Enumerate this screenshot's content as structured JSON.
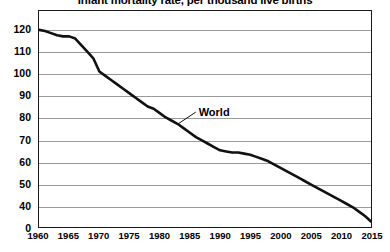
{
  "chart_data": {
    "type": "line",
    "title": "Infant mortality rate, per thousand live births",
    "xlabel": "",
    "ylabel": "",
    "xlim": [
      1960,
      2015
    ],
    "ylim": [
      30,
      120
    ],
    "grid": true,
    "legend_position": "inline-annotation",
    "y_ticks": [
      "120",
      "110",
      "100",
      "90",
      "80",
      "70",
      "60",
      "50",
      "40",
      "0"
    ],
    "y_tick_values": [
      120,
      110,
      100,
      90,
      80,
      70,
      60,
      50,
      40,
      30
    ],
    "y_axis_note": "broken axis: lowest gridline labelled 0 at the baseline",
    "x_ticks": [
      "1960",
      "1965",
      "1970",
      "1975",
      "1980",
      "1985",
      "1990",
      "1995",
      "2000",
      "2005",
      "2010",
      "2015"
    ],
    "x_tick_values": [
      1960,
      1965,
      1970,
      1975,
      1980,
      1985,
      1990,
      1995,
      2000,
      2005,
      2010,
      2015
    ],
    "series": [
      {
        "name": "World",
        "color": "#111111",
        "annotation": "World",
        "x": [
          1960,
          1961,
          1962,
          1963,
          1964,
          1965,
          1966,
          1967,
          1968,
          1969,
          1970,
          1971,
          1972,
          1973,
          1974,
          1975,
          1976,
          1977,
          1978,
          1979,
          1980,
          1981,
          1982,
          1983,
          1984,
          1985,
          1986,
          1987,
          1988,
          1989,
          1990,
          1991,
          1992,
          1993,
          1994,
          1995,
          1996,
          1997,
          1998,
          1999,
          2000,
          2001,
          2002,
          2003,
          2004,
          2005,
          2006,
          2007,
          2008,
          2009,
          2010,
          2011,
          2012,
          2013,
          2014,
          2015
        ],
        "values": [
          120,
          119.5,
          118.5,
          117.5,
          117,
          117,
          116,
          113,
          110,
          107,
          101,
          99,
          97,
          95,
          93,
          91,
          89,
          87,
          85,
          84,
          82,
          80,
          78.5,
          77,
          75,
          73,
          71,
          69.5,
          68,
          66.5,
          65,
          64.5,
          64,
          64,
          63.5,
          63,
          62,
          61,
          60,
          58.5,
          57,
          55.5,
          54,
          52.5,
          51,
          49.5,
          48,
          46.5,
          45,
          43.5,
          42,
          40.5,
          39,
          37,
          35,
          32.5
        ]
      }
    ]
  }
}
